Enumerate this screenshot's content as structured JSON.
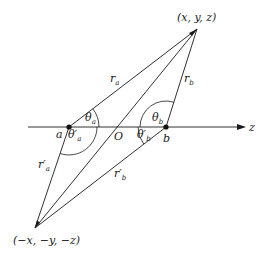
{
  "diagram": {
    "points": {
      "P": {
        "label": "(x, y, z)"
      },
      "P_prime": {
        "label": "(−x, −y, −z)"
      },
      "a": {
        "label": "a"
      },
      "b": {
        "label": "b"
      },
      "O": {
        "label": "O"
      }
    },
    "axis": {
      "label": "z"
    },
    "segments": {
      "r_a": {
        "main": "r",
        "sub": "a"
      },
      "r_b": {
        "main": "r",
        "sub": "b"
      },
      "r_a_prime": {
        "main": "r′",
        "sub": "a"
      },
      "r_b_prime": {
        "main": "r′",
        "sub": "b"
      }
    },
    "angles": {
      "theta_a": {
        "main": "θ",
        "sub": "a"
      },
      "theta_b": {
        "main": "θ",
        "sub": "b"
      },
      "theta_a_prime": {
        "main": "θ′",
        "sub": "a"
      },
      "theta_b_prime": {
        "main": "θ′",
        "sub": "b"
      }
    }
  }
}
